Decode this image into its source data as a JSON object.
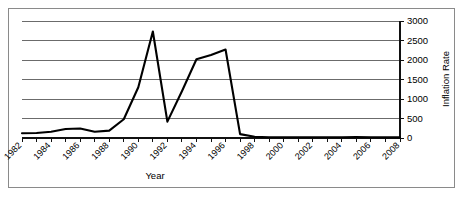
{
  "chart_data": {
    "type": "line",
    "title": "",
    "xlabel": "Year",
    "ylabel": "Inflation Rate",
    "xlim": [
      1982,
      2008
    ],
    "ylim": [
      0,
      3000
    ],
    "grid": true,
    "legend": false,
    "y_axis_position": "right",
    "x_tick_label_rotation": -45,
    "y_ticks": [
      0,
      500,
      1000,
      1500,
      2000,
      2500,
      3000
    ],
    "y_tick_labels": [
      "0",
      "500",
      "1000",
      "1500",
      "2000",
      "2500",
      "3000"
    ],
    "x_ticks": [
      1982,
      1983,
      1984,
      1985,
      1986,
      1987,
      1988,
      1989,
      1990,
      1991,
      1992,
      1993,
      1994,
      1995,
      1996,
      1997,
      1998,
      1999,
      2000,
      2001,
      2002,
      2003,
      2004,
      2005,
      2006,
      2007,
      2008
    ],
    "x_tick_labels": [
      "1982",
      "1984",
      "1986",
      "1988",
      "1990",
      "1992",
      "1994",
      "1996",
      "1998",
      "2000",
      "2002",
      "2004",
      "2006",
      "2008"
    ],
    "x_tick_labels_years": [
      1982,
      1984,
      1986,
      1988,
      1990,
      1992,
      1994,
      1996,
      1998,
      2000,
      2002,
      2004,
      2006,
      2008
    ],
    "x": [
      1982,
      1983,
      1984,
      1985,
      1986,
      1987,
      1988,
      1989,
      1990,
      1991,
      1992,
      1993,
      1994,
      1995,
      1996,
      1997,
      1998,
      1999,
      2000,
      2001,
      2002,
      2003,
      2004,
      2005,
      2006,
      2007,
      2008
    ],
    "values": [
      120,
      130,
      160,
      230,
      245,
      160,
      190,
      480,
      1300,
      2730,
      420,
      1200,
      2020,
      2130,
      2270,
      100,
      30,
      20,
      20,
      20,
      20,
      20,
      20,
      25,
      20,
      15,
      15
    ],
    "series": [
      {
        "name": "Inflation Rate",
        "color": "#000000",
        "values": [
          120,
          130,
          160,
          230,
          245,
          160,
          190,
          480,
          1300,
          2730,
          420,
          1200,
          2020,
          2130,
          2270,
          100,
          30,
          20,
          20,
          20,
          20,
          20,
          20,
          25,
          20,
          15,
          15
        ]
      }
    ]
  }
}
